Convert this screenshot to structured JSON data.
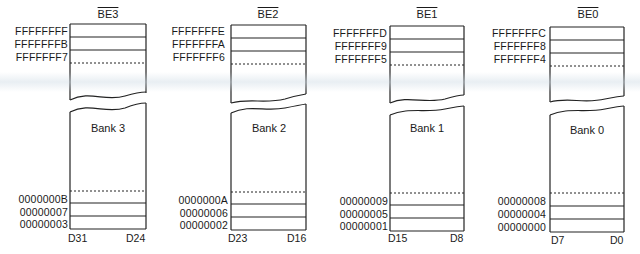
{
  "diagram": {
    "banks": [
      {
        "enable": "BE3",
        "name": "Bank 3",
        "top_addresses": [
          "FFFFFFFF",
          "FFFFFFFB",
          "FFFFFFF7"
        ],
        "bottom_addresses": [
          "0000000B",
          "00000007",
          "00000003"
        ],
        "data_msb": "D31",
        "data_lsb": "D24"
      },
      {
        "enable": "BE2",
        "name": "Bank 2",
        "top_addresses": [
          "FFFFFFFE",
          "FFFFFFFA",
          "FFFFFFF6"
        ],
        "bottom_addresses": [
          "0000000A",
          "00000006",
          "00000002"
        ],
        "data_msb": "D23",
        "data_lsb": "D16"
      },
      {
        "enable": "BE1",
        "name": "Bank 1",
        "top_addresses": [
          "FFFFFFFD",
          "FFFFFFF9",
          "FFFFFFF5"
        ],
        "bottom_addresses": [
          "00000009",
          "00000005",
          "00000001"
        ],
        "data_msb": "D15",
        "data_lsb": "D8"
      },
      {
        "enable": "BE0",
        "name": "Bank 0",
        "top_addresses": [
          "FFFFFFFC",
          "FFFFFFF8",
          "FFFFFFF4"
        ],
        "bottom_addresses": [
          "00000008",
          "00000004",
          "00000000"
        ],
        "data_msb": "D7",
        "data_lsb": "D0"
      }
    ],
    "colors": {
      "line": "#222222",
      "text": "#1a1a1a",
      "background": "#ffffff"
    }
  }
}
